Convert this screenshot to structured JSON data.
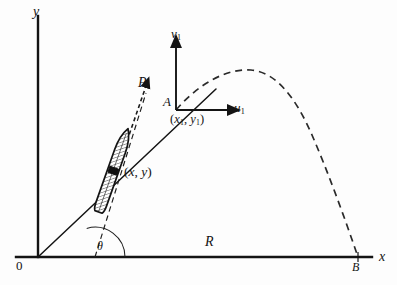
{
  "figure": {
    "kind": "projectile-trajectory-diagram",
    "background_color": "#fdfdfd",
    "ink_color": "#141414"
  },
  "axes": {
    "y_label": "y",
    "x_label": "x",
    "origin_label": "0"
  },
  "points": {
    "burnout_label": "A",
    "burnout_coords": {
      "open": "(",
      "x_symbol": "x",
      "x_sub": "1",
      "comma": ", ",
      "y_symbol": "y",
      "y_sub": "1",
      "close": ")"
    },
    "impact_label": "B",
    "body_coords": {
      "open": "(",
      "x_symbol": "x",
      "comma": ", ",
      "y_symbol": "y",
      "close": ")"
    }
  },
  "local_frame": {
    "vertical_axis_label": "v",
    "vertical_axis_sub": "1",
    "horizontal_axis_label": "u",
    "horizontal_axis_sub": "1"
  },
  "vectors": {
    "thrust_label": "P"
  },
  "measures": {
    "range_label": "R",
    "angle_label": "θ"
  },
  "geometry": {
    "origin": [
      38,
      257
    ],
    "y_axis_top": [
      38,
      16
    ],
    "x_axis_right": [
      372,
      257
    ],
    "burnout_point": [
      176,
      110
    ],
    "impact_point": [
      358,
      257
    ],
    "apex_point": [
      250,
      70
    ],
    "body_center": [
      113,
      171
    ],
    "boost_line_from": [
      38,
      257
    ],
    "boost_line_to": [
      215,
      90
    ],
    "axis_line_color": "#141414",
    "dashed_line_color": "#2a2a2a",
    "theta_arc_center": [
      95,
      257
    ],
    "theta_arc_radius": 30
  }
}
